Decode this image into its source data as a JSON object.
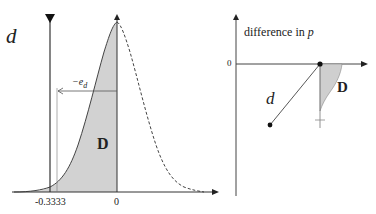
{
  "left_panel": {
    "d_label": "d",
    "elasticity_label_prefix": "−e",
    "elasticity_label_sub": "d",
    "region_label": "D",
    "x_ticks": [
      "-0.3333",
      "0"
    ],
    "curve": "bell-shaped density; solid left of 0 (shaded area D), dashed right of 0"
  },
  "right_panel": {
    "y_axis_label_prefix": "difference in ",
    "y_axis_label_var": "p",
    "y_tick": "0",
    "d_label": "d",
    "region_label": "D"
  },
  "colors": {
    "line": "#333333",
    "shade": "#cfcfcf",
    "background": "#ffffff"
  }
}
